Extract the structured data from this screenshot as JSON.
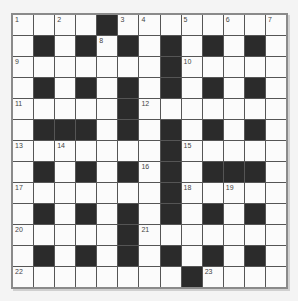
{
  "puzzle": {
    "type": "crossword",
    "rows": 13,
    "cols": 13,
    "layout": [
      "WWWW#WWWWWWWW",
      "W#W#W#W#W#W#W",
      "WWWWWWW#WWWWW",
      "W#W#W#W#W#W#W",
      "WWWWW#WWWWWWW",
      "W###W#W#W#W#W",
      "WWWWWWW#WWWWW",
      "W#W#W#W#W###W",
      "WWWWWWW#WWWWW",
      "W#W#W#W#W#W#W",
      "WWWWW#WWWWWWW",
      "W#W#W#W#W#W#W",
      "WWWWWWWW#WWWW"
    ],
    "numbers": [
      {
        "n": "1",
        "r": 0,
        "c": 0
      },
      {
        "n": "2",
        "r": 0,
        "c": 2
      },
      {
        "n": "3",
        "r": 0,
        "c": 5
      },
      {
        "n": "4",
        "r": 0,
        "c": 6
      },
      {
        "n": "5",
        "r": 0,
        "c": 8
      },
      {
        "n": "6",
        "r": 0,
        "c": 10
      },
      {
        "n": "7",
        "r": 0,
        "c": 12
      },
      {
        "n": "8",
        "r": 1,
        "c": 4
      },
      {
        "n": "9",
        "r": 2,
        "c": 0
      },
      {
        "n": "10",
        "r": 2,
        "c": 8
      },
      {
        "n": "11",
        "r": 4,
        "c": 0
      },
      {
        "n": "12",
        "r": 4,
        "c": 6
      },
      {
        "n": "13",
        "r": 6,
        "c": 0
      },
      {
        "n": "14",
        "r": 6,
        "c": 2
      },
      {
        "n": "15",
        "r": 6,
        "c": 8
      },
      {
        "n": "16",
        "r": 7,
        "c": 6
      },
      {
        "n": "17",
        "r": 8,
        "c": 0
      },
      {
        "n": "18",
        "r": 8,
        "c": 8
      },
      {
        "n": "19",
        "r": 8,
        "c": 10
      },
      {
        "n": "20",
        "r": 10,
        "c": 0
      },
      {
        "n": "21",
        "r": 10,
        "c": 6
      },
      {
        "n": "22",
        "r": 12,
        "c": 0
      },
      {
        "n": "23",
        "r": 12,
        "c": 9
      }
    ]
  },
  "colors": {
    "background": "#f4f4f4",
    "cell_white": "#fbfbfb",
    "cell_black": "#2b2b2b",
    "grid_line": "#555555",
    "border": "#8a8a8a"
  }
}
